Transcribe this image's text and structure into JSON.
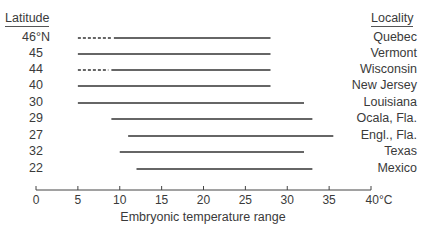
{
  "chart_data": {
    "type": "range-bar",
    "title": "",
    "xlabel": "Embryonic temperature range",
    "ylabel_left": "Latitude",
    "ylabel_right": "Locality",
    "xlim": [
      0,
      40
    ],
    "x_ticks": [
      0,
      5,
      10,
      15,
      20,
      25,
      30,
      35,
      40
    ],
    "x_tick_labels": [
      "0",
      "5",
      "10",
      "15",
      "20",
      "25",
      "30",
      "35",
      "40°C"
    ],
    "grid": false,
    "rows": [
      {
        "latitude": "46°N",
        "locality": "Quebec",
        "dashed_from": 5,
        "start": 9.3,
        "end": 28
      },
      {
        "latitude": "45",
        "locality": "Vermont",
        "dashed_from": null,
        "start": 5,
        "end": 28
      },
      {
        "latitude": "44",
        "locality": "Wisconsin",
        "dashed_from": 5,
        "start": 9,
        "end": 28
      },
      {
        "latitude": "40",
        "locality": "New Jersey",
        "dashed_from": null,
        "start": 5,
        "end": 28
      },
      {
        "latitude": "30",
        "locality": "Louisiana",
        "dashed_from": null,
        "start": 5,
        "end": 32
      },
      {
        "latitude": "29",
        "locality": "Ocala, Fla.",
        "dashed_from": null,
        "start": 9,
        "end": 33
      },
      {
        "latitude": "27",
        "locality": "Engl., Fla.",
        "dashed_from": null,
        "start": 11,
        "end": 35.5
      },
      {
        "latitude": "32",
        "locality": "Texas",
        "dashed_from": null,
        "start": 10,
        "end": 32
      },
      {
        "latitude": "22",
        "locality": "Mexico",
        "dashed_from": null,
        "start": 12,
        "end": 33
      }
    ]
  },
  "labels": {
    "latitude_header": "Latitude",
    "locality_header": "Locality",
    "xlabel": "Embryonic temperature range"
  }
}
